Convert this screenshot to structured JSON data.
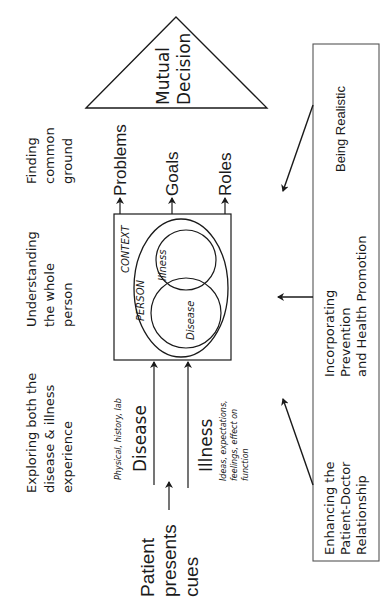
{
  "diagram": {
    "title_rotation": "-90deg",
    "colors": {
      "ink": "#1a1a1a",
      "background": "#ffffff",
      "box_border": "#555555"
    },
    "components": [
      {
        "id": "exploring",
        "label_lines": [
          "Exploring both the",
          "disease & illness",
          "experience"
        ]
      },
      {
        "id": "understanding",
        "label_lines": [
          "Understanding",
          "the whole",
          "person"
        ]
      },
      {
        "id": "finding",
        "label_lines": [
          "Finding",
          "common",
          "ground"
        ]
      }
    ],
    "start": {
      "label_lines": [
        "Patient",
        "presents",
        "cues"
      ]
    },
    "inputs": [
      {
        "id": "disease",
        "label": "Disease",
        "note": "Physical, history, lab"
      },
      {
        "id": "illness",
        "label": "Illness",
        "note_lines": [
          "Ideas, expectations,",
          "feelings, effect on",
          "function"
        ]
      }
    ],
    "center_box": {
      "context_label": "CONTEXT",
      "person_label": "PERSON",
      "circle_top_label": "Illness",
      "circle_bottom_label": "Disease"
    },
    "outputs": [
      {
        "id": "problems",
        "label": "Problems"
      },
      {
        "id": "goals",
        "label": "Goals"
      },
      {
        "id": "roles",
        "label": "Roles"
      }
    ],
    "decision": {
      "label_lines": [
        "Mutual",
        "Decision"
      ]
    },
    "side_box": {
      "items": [
        {
          "id": "realistic",
          "label_lines": [
            "Being Realistic"
          ]
        },
        {
          "id": "prevention",
          "label_lines": [
            "Incorporating",
            "Prevention",
            "and Health Promotion"
          ]
        },
        {
          "id": "relationship",
          "label_lines": [
            "Enhancing the",
            "Patient-Doctor",
            "Relationship"
          ]
        }
      ]
    }
  }
}
